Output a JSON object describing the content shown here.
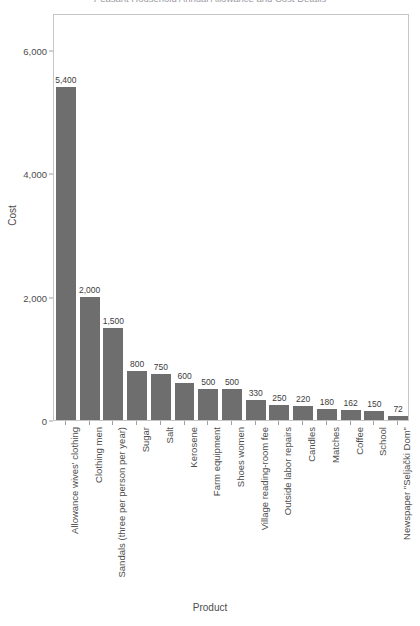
{
  "chart_data": {
    "type": "bar",
    "title": "Peasant Household Annual Allowance and Cost Details",
    "xlabel": "Product",
    "ylabel": "Cost",
    "ylim": [
      0,
      6600
    ],
    "yticks": [
      0,
      2000,
      4000,
      6000
    ],
    "ytick_labels": [
      "0",
      "2,000",
      "4,000",
      "6,000"
    ],
    "grid": false,
    "legend": "none",
    "bar_color": "#6e6e6e",
    "panel_border_color": "#c6c6c6",
    "categories": [
      "Allowance wives' clothing",
      "Clothing men",
      "Sandals (three per person per year)",
      "Sugar",
      "Salt",
      "Kerosene",
      "Farm equipment",
      "Shoes women",
      "Village reading-room fee",
      "Outside labor repairs",
      "Candles",
      "Matches",
      "Coffee",
      "School",
      "Newspaper \"Seljački Dom\""
    ],
    "values": [
      5400,
      2000,
      1500,
      800,
      750,
      600,
      500,
      500,
      330,
      250,
      220,
      180,
      162,
      150,
      72
    ],
    "value_labels": [
      "5,400",
      "2,000",
      "1,500",
      "800",
      "750",
      "600",
      "500",
      "500",
      "330",
      "250",
      "220",
      "180",
      "162",
      "150",
      "72"
    ]
  }
}
